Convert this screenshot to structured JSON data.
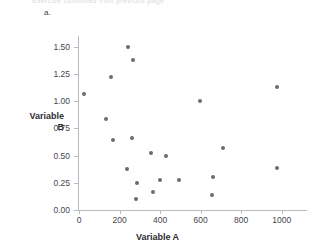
{
  "figure": {
    "cutoff_header": "Exercise continued from previous page",
    "part_label": "a.",
    "watermark": ""
  },
  "chart_data": {
    "type": "scatter",
    "title": "",
    "xlabel": "Variable A",
    "ylabel": "Variable B",
    "xlim": [
      0,
      1100
    ],
    "ylim": [
      0.0,
      1.6
    ],
    "xticks": [
      0,
      200,
      400,
      600,
      800,
      1000
    ],
    "xtick_labels": [
      "0",
      "200",
      "400",
      "600",
      "800",
      "1000"
    ],
    "yticks": [
      0.0,
      0.25,
      0.5,
      0.75,
      1.0,
      1.25,
      1.5
    ],
    "ytick_labels": [
      "0.00",
      "0.25",
      "0.50",
      "0.75",
      "1.00",
      "1.25",
      "1.50"
    ],
    "grid": false,
    "legend": false,
    "marker_color": "#6b6b70",
    "points": [
      {
        "x": 25,
        "y": 1.07
      },
      {
        "x": 135,
        "y": 0.84
      },
      {
        "x": 160,
        "y": 1.22
      },
      {
        "x": 170,
        "y": 0.64
      },
      {
        "x": 237,
        "y": 0.38
      },
      {
        "x": 240,
        "y": 1.5
      },
      {
        "x": 262,
        "y": 0.66
      },
      {
        "x": 268,
        "y": 1.38
      },
      {
        "x": 283,
        "y": 0.1
      },
      {
        "x": 288,
        "y": 0.25
      },
      {
        "x": 355,
        "y": 0.52
      },
      {
        "x": 365,
        "y": 0.17
      },
      {
        "x": 400,
        "y": 0.28
      },
      {
        "x": 430,
        "y": 0.5
      },
      {
        "x": 495,
        "y": 0.28
      },
      {
        "x": 595,
        "y": 1.0
      },
      {
        "x": 655,
        "y": 0.14
      },
      {
        "x": 660,
        "y": 0.3
      },
      {
        "x": 710,
        "y": 0.57
      },
      {
        "x": 975,
        "y": 1.13
      },
      {
        "x": 978,
        "y": 0.39
      }
    ]
  }
}
